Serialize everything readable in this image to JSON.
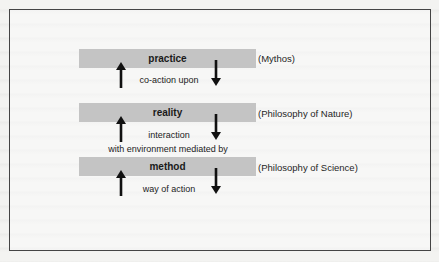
{
  "diagram": {
    "levels": [
      {
        "label": "practice",
        "annotation": "(Mythos)"
      },
      {
        "label": "reality",
        "annotation": "(Philosophy of Nature)"
      },
      {
        "label": "method",
        "annotation": "(Philosophy of Science)"
      }
    ],
    "connections": [
      {
        "text": "co-action upon"
      },
      {
        "text_line1": "interaction",
        "text_line2": "with environment mediated by"
      },
      {
        "text": "way of action"
      }
    ],
    "arrow_icons": [
      "arrow-up-icon",
      "arrow-down-icon"
    ],
    "colors": {
      "bar": "#c4c4c4",
      "frame": "#444444",
      "arrow": "#111111",
      "background": "#f3f3f1"
    }
  }
}
